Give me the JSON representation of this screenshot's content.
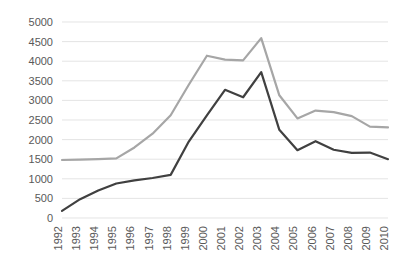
{
  "chart_data": {
    "type": "line",
    "title": "",
    "subtitle": "",
    "xlabel": "",
    "ylabel": "",
    "categories": [
      "1992",
      "1993",
      "1994",
      "1995",
      "1996",
      "1997",
      "1998",
      "1999",
      "2000",
      "2001",
      "2002",
      "2003",
      "2004",
      "2005",
      "2006",
      "2007",
      "2008",
      "2009",
      "2010"
    ],
    "x": [
      1992,
      1993,
      1994,
      1995,
      1996,
      1997,
      1998,
      1999,
      2000,
      2001,
      2002,
      2003,
      2004,
      2005,
      2006,
      2007,
      2008,
      2009,
      2010
    ],
    "ylim": [
      0,
      5000
    ],
    "xlim": [
      "1992",
      "2010"
    ],
    "ytick_labels": [
      "5000",
      "4500",
      "4000",
      "3500",
      "3000",
      "2500",
      "2000",
      "1500",
      "1000",
      "500",
      "0"
    ],
    "ytick_values": [
      5000,
      4500,
      4000,
      3500,
      3000,
      2500,
      2000,
      1500,
      1000,
      500,
      0
    ],
    "grid": true,
    "grid_axis": "y",
    "grid_color": "#d9d9d9",
    "legend": false,
    "legend_position": "none",
    "series": [
      {
        "name": "gray-series",
        "color": "#a6a6a6",
        "stroke_width": 2.2,
        "values": [
          1480,
          1490,
          1500,
          1520,
          1800,
          2150,
          2620,
          3400,
          4140,
          4040,
          4020,
          4590,
          3130,
          2540,
          2740,
          2700,
          2600,
          2330,
          2310
        ]
      },
      {
        "name": "dark-series",
        "color": "#404040",
        "stroke_width": 2.2,
        "values": [
          180,
          480,
          700,
          880,
          960,
          1020,
          1100,
          1950,
          2620,
          3270,
          3080,
          3720,
          2250,
          1730,
          1960,
          1740,
          1660,
          1670,
          1500
        ]
      }
    ]
  },
  "axes": {
    "y_axis_name": "value-axis",
    "x_axis_name": "year-axis"
  }
}
